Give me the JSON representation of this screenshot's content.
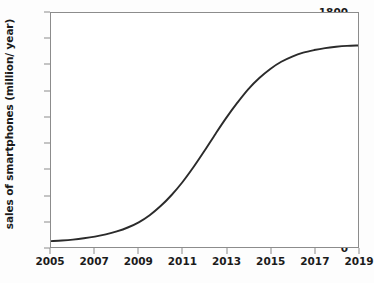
{
  "chart_data": {
    "type": "line",
    "title": "",
    "xlabel": "",
    "ylabel": "sales of smartphones (million/ year)",
    "xlim": [
      2005,
      2019
    ],
    "ylim": [
      0,
      1800
    ],
    "grid": false,
    "legend": false,
    "line_color": "#2b2b2b",
    "frame_color": "#8c8c8c",
    "background": "#ffffff",
    "xticks": [
      2005,
      2007,
      2009,
      2011,
      2013,
      2015,
      2017,
      2019
    ],
    "xtick_labels": [
      "2005",
      "2007",
      "2009",
      "2011",
      "2013",
      "2015",
      "2017",
      "2019"
    ],
    "yticks": [
      0,
      200,
      400,
      600,
      800,
      1000,
      1200,
      1400,
      1600,
      1800
    ],
    "ytick_labels": [
      "0",
      "200",
      "400",
      "600",
      "800",
      "1000",
      "1200",
      "1400",
      "1600",
      "1800"
    ],
    "series": [
      {
        "name": "sales of smartphones",
        "x": [
          2005,
          2005.5,
          2006,
          2006.5,
          2007,
          2007.5,
          2008,
          2008.5,
          2009,
          2009.5,
          2010,
          2010.5,
          2011,
          2011.5,
          2012,
          2012.5,
          2013,
          2013.5,
          2014,
          2014.5,
          2015,
          2015.5,
          2016,
          2016.5,
          2017,
          2017.5,
          2018,
          2018.5,
          2019
        ],
        "values": [
          45,
          50,
          57,
          67,
          80,
          97,
          120,
          150,
          190,
          245,
          315,
          400,
          500,
          615,
          740,
          870,
          995,
          1110,
          1215,
          1300,
          1370,
          1425,
          1465,
          1495,
          1515,
          1530,
          1540,
          1547,
          1550
        ]
      }
    ]
  }
}
